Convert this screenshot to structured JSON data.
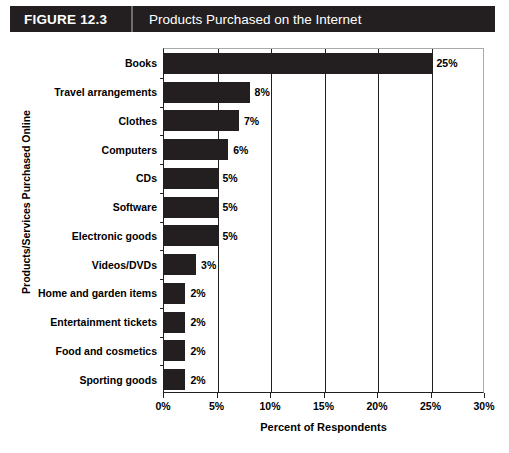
{
  "header": {
    "figure_number": "FIGURE 12.3",
    "title": "Products Purchased on the Internet",
    "bar_color": "#231f20",
    "text_color": "#ffffff"
  },
  "chart_data": {
    "type": "bar",
    "orientation": "horizontal",
    "title": "Products Purchased on the Internet",
    "xlabel": "Percent of Respondents",
    "ylabel": "Products/Services Purchased Online",
    "categories": [
      "Books",
      "Travel arrangements",
      "Clothes",
      "Computers",
      "CDs",
      "Software",
      "Electronic goods",
      "Videos/DVDs",
      "Home and garden items",
      "Entertainment tickets",
      "Food and cosmetics",
      "Sporting goods"
    ],
    "values": [
      25,
      8,
      7,
      6,
      5,
      5,
      5,
      3,
      2,
      2,
      2,
      2
    ],
    "value_labels": [
      "25%",
      "8%",
      "7%",
      "6%",
      "5%",
      "5%",
      "5%",
      "3%",
      "2%",
      "2%",
      "2%",
      "2%"
    ],
    "xlim": [
      0,
      30
    ],
    "xticks": [
      0,
      5,
      10,
      15,
      20,
      25,
      30
    ],
    "xtick_labels": [
      "0%",
      "5%",
      "10%",
      "15%",
      "20%",
      "25%",
      "30%"
    ],
    "grid": "vertical",
    "legend": null,
    "bar_color": "#231f20",
    "gridline_color": "#231f20"
  }
}
